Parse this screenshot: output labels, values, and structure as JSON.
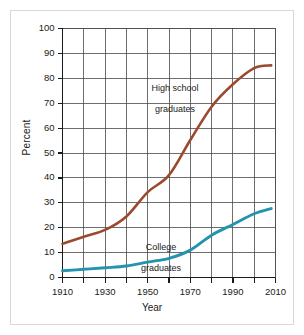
{
  "figure": {
    "frame_color": "#d8d8d8",
    "background": "#ffffff"
  },
  "chart_data": {
    "type": "line",
    "title": "",
    "xlabel": "Year",
    "ylabel": "Percent",
    "xlim": [
      1910,
      2010
    ],
    "ylim": [
      0,
      100
    ],
    "grid": true,
    "legend_position": "inline-annotation",
    "xticks": [
      1910,
      1930,
      1950,
      1970,
      1990,
      2010
    ],
    "xtick_labels": [
      "1910",
      "1930",
      "1950",
      "1970",
      "1990",
      "2010"
    ],
    "xminor_ticks": [
      1920,
      1940,
      1960,
      1980,
      2000
    ],
    "yticks": [
      0,
      10,
      20,
      30,
      40,
      50,
      60,
      70,
      80,
      90,
      100
    ],
    "ytick_labels": [
      "0",
      "10",
      "20",
      "30",
      "40",
      "50",
      "60",
      "70",
      "80",
      "90",
      "100"
    ],
    "x": [
      1910,
      1920,
      1930,
      1940,
      1950,
      1960,
      1970,
      1980,
      1990,
      2000,
      2008
    ],
    "series": [
      {
        "name": "High school graduates",
        "color": "#9C4A2F",
        "label_line1": "High school",
        "label_line2": "graduates",
        "values": [
          13.5,
          16.4,
          19.1,
          24.5,
          34.3,
          41.1,
          55.2,
          68.6,
          77.6,
          84.1,
          85.2
        ]
      },
      {
        "name": "College graduates",
        "color": "#2494AE",
        "label_line1": "College",
        "label_line2": "graduates",
        "values": [
          2.7,
          3.3,
          3.9,
          4.6,
          6.2,
          7.7,
          11.0,
          17.0,
          21.3,
          25.6,
          27.7
        ]
      }
    ]
  }
}
